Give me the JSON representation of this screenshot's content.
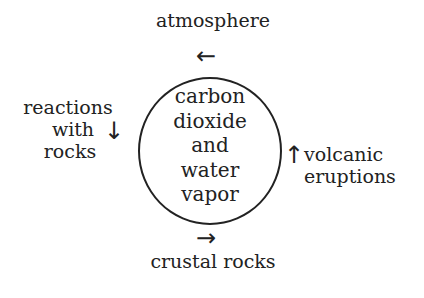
{
  "diagram": {
    "top_label": "atmosphere",
    "bottom_label": "crustal rocks",
    "left_label": [
      "reactions",
      "with",
      "rocks"
    ],
    "right_label": [
      "volcanic",
      "eruptions"
    ],
    "center_label": [
      "carbon",
      "dioxide",
      "and",
      "water",
      "vapor"
    ],
    "arrows": {
      "top": "←",
      "bottom": "→",
      "left": "↓",
      "right": "↑"
    }
  }
}
